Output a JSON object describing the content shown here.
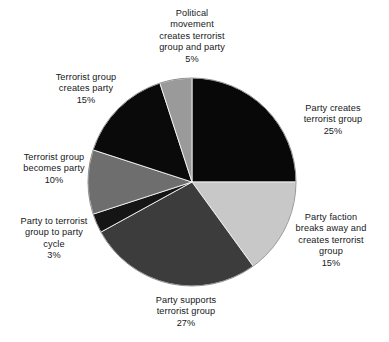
{
  "figure": {
    "background_color": "#ffffff",
    "width": 389,
    "height": 342
  },
  "chart_data": {
    "type": "pie",
    "title": "",
    "subtitle": "",
    "xlabel": "",
    "ylabel": "",
    "legend_position": "none",
    "labels_position": "outside-callout-text",
    "grid": false,
    "start_angle_deg": 0,
    "direction": "clockwise",
    "center": {
      "cx": 192,
      "cy": 182,
      "r": 104
    },
    "categories": [
      "Party creates terrorist group",
      "Party faction breaks away and creates terrorist group",
      "Party supports terrorist group",
      "Party to terrorist group to party cycle",
      "Terrorist group becomes party",
      "Terrorist group creates party",
      "Political movement creates terrorist group and party"
    ],
    "values": [
      25,
      15,
      27,
      3,
      10,
      15,
      5
    ],
    "total": 100,
    "units": "percent",
    "colors": [
      "#080808",
      "#c8c8c8",
      "#3c3c3c",
      "#151515",
      "#6e6e6e",
      "#0a0a0a",
      "#9a9a9a"
    ],
    "slices": [
      {
        "label": "Party creates terrorist group",
        "label_lines": "Party creates\nterrorist group",
        "value": 25,
        "percent_text": "25%",
        "color": "#080808",
        "start_deg": 0,
        "end_deg": 90
      },
      {
        "label": "Party faction breaks away and creates terrorist group",
        "label_lines": "Party faction\nbreaks away and\ncreates terrorist\ngroup",
        "value": 15,
        "percent_text": "15%",
        "color": "#c8c8c8",
        "start_deg": 90,
        "end_deg": 144
      },
      {
        "label": "Party supports terrorist group",
        "label_lines": "Party supports\nterrorist group",
        "value": 27,
        "percent_text": "27%",
        "color": "#3c3c3c",
        "start_deg": 144,
        "end_deg": 241.2
      },
      {
        "label": "Party to terrorist group to party cycle",
        "label_lines": "Party to terrorist\ngroup to party\ncycle",
        "value": 3,
        "percent_text": "3%",
        "color": "#151515",
        "start_deg": 241.2,
        "end_deg": 252
      },
      {
        "label": "Terrorist group becomes party",
        "label_lines": "Terrorist group\nbecomes party",
        "value": 10,
        "percent_text": "10%",
        "color": "#6e6e6e",
        "start_deg": 252,
        "end_deg": 288
      },
      {
        "label": "Terrorist group creates party",
        "label_lines": "Terrorist group\ncreates party",
        "value": 15,
        "percent_text": "15%",
        "color": "#0a0a0a",
        "start_deg": 288,
        "end_deg": 342
      },
      {
        "label": "Political movement creates terrorist group and party",
        "label_lines": "Political\nmovement\ncreates terrorist\ngroup and party",
        "value": 5,
        "percent_text": "5%",
        "color": "#9a9a9a",
        "start_deg": 342,
        "end_deg": 360
      }
    ]
  },
  "caption": {
    "text": ""
  }
}
